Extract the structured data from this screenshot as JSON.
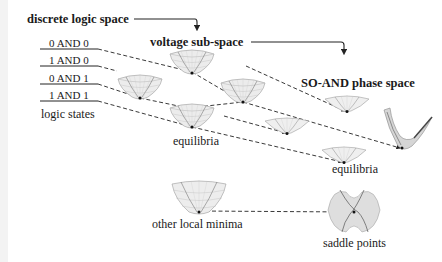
{
  "diagram": {
    "titles": {
      "discrete_logic_space": "discrete logic space",
      "voltage_sub_space": "voltage sub-space",
      "so_and_phase_space": "SO-AND phase space"
    },
    "logic_states": [
      {
        "label": "0 AND 0"
      },
      {
        "label": "1 AND 0"
      },
      {
        "label": "0 AND 1"
      },
      {
        "label": "1 AND 1"
      }
    ],
    "captions": {
      "logic_states": "logic states",
      "equilibria_voltage": "equilibria",
      "equilibria_phase": "equilibria",
      "other_local_minima": "other local minima",
      "saddle_points": "saddle points"
    },
    "colors": {
      "text": "#1a1a1a",
      "line": "#222222",
      "surface_fill": "#e6e6e6",
      "surface_grid": "#a8a8a8",
      "surface_edge": "#555555"
    }
  }
}
